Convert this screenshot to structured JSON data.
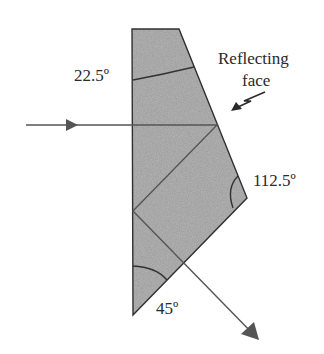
{
  "diagram": {
    "type": "prism-ray-diagram",
    "colors": {
      "prism_fill": "#b9b9b9",
      "outline": "#333333",
      "ray": "#555555",
      "text": "#2a2a2a"
    },
    "prism_vertices": [
      [
        132,
        29
      ],
      [
        179,
        29
      ],
      [
        247,
        198
      ],
      [
        133,
        315
      ]
    ],
    "ray_path": [
      [
        26,
        125
      ],
      [
        217,
        125
      ],
      [
        133,
        211
      ],
      [
        258,
        339
      ]
    ],
    "labels": {
      "top_angle": "22.5º",
      "right_angle": "112.5º",
      "bottom_angle": "45º",
      "reflecting_face_line1": "Reflecting",
      "reflecting_face_line2": "face"
    },
    "icons": {
      "input_arrow": "arrowhead-right",
      "output_arrow": "arrowhead-down-right",
      "pointer": "lightning-arrow"
    }
  }
}
